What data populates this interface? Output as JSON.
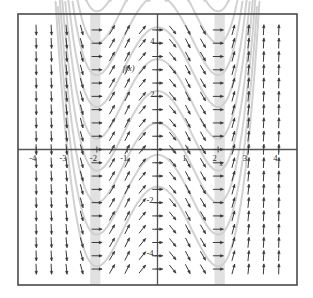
{
  "figure": {
    "kind": "direction-field-with-solution-curves",
    "background_color": "#ffffff",
    "frame_color": "#4a4a4a",
    "axis_color": "#555555",
    "arrow_color": "#3a3a3a",
    "curve_color": "#cfcfcf",
    "band_color": "#dcdcdc",
    "frame": {
      "x": 18,
      "y": 14,
      "width": 279,
      "height": 271
    }
  },
  "labels": {
    "curve_label": "f(x)",
    "x_axis_name": "x"
  },
  "chart_data": {
    "type": "line",
    "title": "",
    "subtitle": "",
    "xlabel": "x",
    "ylabel": "",
    "grid": false,
    "legend": "none",
    "xlim": [
      -4.6,
      4.6
    ],
    "ylim": [
      -5.1,
      5.1
    ],
    "xticks": [
      -4,
      -3,
      -2,
      -1,
      1,
      2,
      3,
      4
    ],
    "xtick_labels": [
      "-4",
      "-3",
      "-2",
      "-1",
      "1",
      "2",
      "3",
      "4"
    ],
    "yticks": [
      -4,
      -2,
      2,
      4
    ],
    "ytick_labels": [
      "-4",
      "-2",
      "2",
      "4"
    ],
    "annotations": [
      {
        "text": "f(x)",
        "x": -0.95,
        "y": 2.95
      },
      {
        "text": "x",
        "x": 2.1,
        "y": -0.62
      }
    ],
    "slope_field": {
      "description": "Arrows of a direction field; slope depends on x only, dy/dx = 3*(x^3 - 4*x)/4. Near-vertical upward arrows outside |x|>2.6, downward-left arrows for x<-2.6 at top rows reading as steep negatives, rotating through horizontal near x=-2, 0 and 2.",
      "slope_formula": "dy/dx = 0.75*(x^3 - 4*x)",
      "x_samples": [
        -4.0,
        -3.5,
        -3.0,
        -2.5,
        -2.0,
        -1.5,
        -1.0,
        -0.5,
        0.0,
        0.5,
        1.0,
        1.5,
        2.0,
        2.5,
        3.0,
        3.5,
        4.0
      ],
      "y_samples": [
        -4.5,
        -4.0,
        -3.5,
        -3.0,
        -2.5,
        -2.0,
        -1.5,
        -1.0,
        -0.5,
        0.0,
        0.5,
        1.0,
        1.5,
        2.0,
        2.5,
        3.0,
        3.5,
        4.0,
        4.5
      ],
      "zero_slope_x": [
        -2,
        0,
        2
      ],
      "arrow_count_x": 17,
      "arrow_count_y": 19
    },
    "solution_curves": {
      "description": "Family of antiderivative curves y = 0.75*(x^4/4 - 2*x^2) + C, W-shaped with local maximum at x=0 and minima at x=-2 and x=+2.",
      "formula": "y = 0.1875*x^4 - 1.5*x^2 + C",
      "constants": [
        -1.4,
        -0.2,
        1.0,
        2.2,
        3.4,
        4.6,
        5.8,
        7.0,
        8.2
      ],
      "local_max_x": 0,
      "local_min_x": [
        -2,
        2
      ]
    },
    "shaded_bands": [
      {
        "x_center": -2.05,
        "half_width": 0.17,
        "color": "#dcdcdc"
      },
      {
        "x_center": 2.05,
        "half_width": 0.17,
        "color": "#dcdcdc"
      }
    ]
  }
}
